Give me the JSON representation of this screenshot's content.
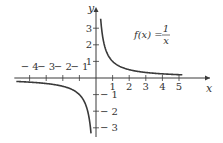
{
  "chart_data": {
    "type": "line",
    "title": "",
    "function_label": {
      "lhs": "f(x) =",
      "numerator": "1",
      "denominator": "x"
    },
    "xlabel": "x",
    "ylabel": "y",
    "xlim": [
      -4.8,
      6.8
    ],
    "ylim": [
      -3.6,
      4.2
    ],
    "x_ticks": [
      -4,
      -3,
      -2,
      -1,
      1,
      2,
      3,
      4,
      5
    ],
    "x_tick_labels": [
      "− 4",
      "− 3",
      "− 2",
      "− 1",
      "1",
      "2",
      "3",
      "4",
      "5"
    ],
    "y_ticks": [
      3,
      2,
      1,
      -1,
      -2,
      -3
    ],
    "y_tick_labels": [
      "3",
      "2",
      "1",
      "− 1",
      "− 2",
      "− 3"
    ],
    "grid": false,
    "legend": "none",
    "series": [
      {
        "name": "f(x) = 1/x (x>0)",
        "x": [
          0.28,
          0.4,
          0.5,
          0.75,
          1,
          1.5,
          2,
          3,
          4,
          5.2
        ],
        "y": [
          3.6,
          2.5,
          2,
          1.33,
          1,
          0.67,
          0.5,
          0.33,
          0.25,
          0.19
        ]
      },
      {
        "name": "f(x) = 1/x (x<0)",
        "x": [
          -4.8,
          -4,
          -3,
          -2,
          -1.5,
          -1,
          -0.75,
          -0.5,
          -0.4,
          -0.3
        ],
        "y": [
          -0.21,
          -0.25,
          -0.33,
          -0.5,
          -0.67,
          -1,
          -1.33,
          -2,
          -2.5,
          -3.3
        ]
      }
    ]
  },
  "layout": {
    "origin_px": [
      96,
      78
    ],
    "unit_px": 16.6,
    "color": "#3a3a3a"
  }
}
